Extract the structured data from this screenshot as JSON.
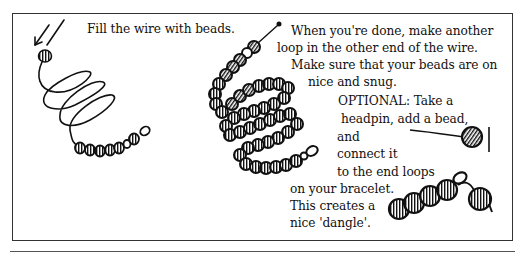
{
  "instructions": {
    "step_fill": "Fill the wire with beads.",
    "step_loop": [
      "When you're done, make another",
      "loop in the other end of the wire.",
      "Make sure that your beads are on",
      "nice and snug."
    ],
    "optional": [
      "OPTIONAL: Take a",
      "headpin, add a bead,",
      "and",
      "connect it",
      "to the end loops",
      "on your bracelet.",
      "This creates a",
      "nice 'dangle'."
    ]
  },
  "illustrations": {
    "left": "wire-spiral-with-few-beads",
    "middle": "coiled-wire-filled-with-beads",
    "right_top": "headpin-with-bead",
    "right_bottom": "bracelet-end-with-dangle"
  },
  "colors": {
    "ink": "#111111",
    "border": "#333333",
    "background": "#ffffff"
  }
}
